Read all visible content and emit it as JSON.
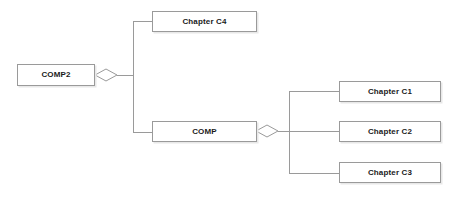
{
  "diagram": {
    "type": "uml-aggregation-diagram",
    "title": "",
    "background_color": "#ffffff",
    "box_border_color": "#9a9a9a",
    "box_fill_color": "#ffffff",
    "edge_color": "#9a9a9a",
    "text_color": "#1a1a1a",
    "nodes": [
      {
        "id": "comp2",
        "label": "COMP2",
        "x": 17,
        "y": 64,
        "width": 78,
        "height": 22
      },
      {
        "id": "chapter-c4",
        "label": "Chapter C4",
        "x": 152,
        "y": 11,
        "width": 105,
        "height": 21
      },
      {
        "id": "comp",
        "label": "COMP",
        "x": 152,
        "y": 121,
        "width": 105,
        "height": 21
      },
      {
        "id": "chapter-c1",
        "label": "Chapter C1",
        "x": 339,
        "y": 81,
        "width": 102,
        "height": 21
      },
      {
        "id": "chapter-c2",
        "label": "Chapter C2",
        "x": 339,
        "y": 121,
        "width": 102,
        "height": 21
      },
      {
        "id": "chapter-c3",
        "label": "Chapter C3",
        "x": 339,
        "y": 162,
        "width": 102,
        "height": 21
      }
    ],
    "aggregations": [
      {
        "id": "comp2-aggregation",
        "whole": "comp2",
        "parts": [
          "chapter-c4",
          "comp"
        ],
        "diamond_center_x": 106,
        "diamond_center_y": 75
      },
      {
        "id": "comp-aggregation",
        "whole": "comp",
        "parts": [
          "chapter-c1",
          "chapter-c2",
          "chapter-c3"
        ],
        "diamond_center_x": 267,
        "diamond_center_y": 131
      }
    ]
  }
}
